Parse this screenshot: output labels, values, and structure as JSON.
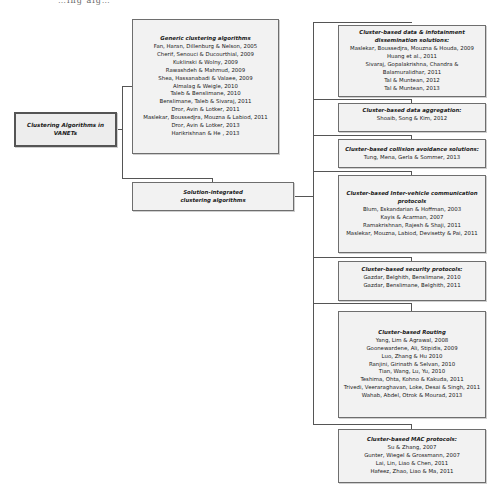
{
  "caption_fragment": "…ing alg…",
  "root": {
    "label": "Clustering Algorithms in VANETs"
  },
  "generic": {
    "title": "Generic clustering algorithms",
    "refs": [
      "Fan, Haran, Dillenburg & Nelson, 2005",
      "Cherif, Senouci & Ducourthial, 2009",
      "Kuklinski & Wolny, 2009",
      "Rawashdeh & Mahmud, 2009",
      "Shea, Hassanabadi & Valaee, 2009",
      "Almalag & Weigle, 2010",
      "Taleb & Benslimane, 2010",
      "Benslimane, Taleb & Sivaraj, 2011",
      "Dror, Avin & Lotker, 2011",
      "Maslekar, Boussedjra, Mouzna & Labiod, 2011",
      "Dror, Avin & Lotker, 2013",
      "Harikrishnan & He , 2013"
    ]
  },
  "solution": {
    "label": "Solution-integrated clustering algorithms"
  },
  "categories": [
    {
      "title": "Cluster-based data & infotainment dissemination solutions:",
      "refs": [
        "Maslekar, Boussedjra, Mouzna & Houda, 2009",
        "Huang et al., 2011",
        "Sivaraj, Gopalakrishna, Chandra & Balamuralidhar, 2011",
        "Tal & Muntean, 2012",
        "Tal & Muntean, 2013"
      ]
    },
    {
      "title": "Cluster-based data aggregation:",
      "refs": [
        "Shoaib,  Song & Kim, 2012"
      ]
    },
    {
      "title": "Cluster-based collision avoidance solutions:",
      "refs": [
        "Tung, Mena,  Gerla & Sommer, 2013"
      ]
    },
    {
      "title": "Cluster-based Inter-vehicle communication protocols",
      "refs": [
        "Blum, Eskandarian & Hoffman, 2003",
        "Kayis & Acarman, 2007",
        "Ramakrishnan, Rajesh & Shaji, 2011",
        "Maslekar, Mouzna, Labiod, Devisetty & Pai, 2011"
      ]
    },
    {
      "title": "Cluster-based security protocols:",
      "refs": [
        "Gazdar, Belghith, Benslimane, 2010",
        "Gazdar, Benslimane, Belghith, 2011"
      ]
    },
    {
      "title": "Cluster-based Routing",
      "refs": [
        "Yang, Lim & Agrawal, 2008",
        "Goonewardene, Ali, Stipidis, 2009",
        "Luo, Zhang & Hu 2010",
        "Ranjini, Girinath & Selvan, 2010",
        "Tian, Wang, Lu, Yu, 2010",
        "Teshima, Ohta, Kohno & Kakuda, 2011",
        "Trivedi, Veeraraghavan, Loke, Desai & Singh, 2011",
        "Wahab, Abdel, Otrok & Mourad, 2013"
      ]
    },
    {
      "title": "Cluster-based MAC protocols:",
      "refs": [
        "Su & Zhang, 2007",
        "Gunter, Wiegel & Grossmann, 2007",
        "Lai, Lin, Liao & Chen, 2011",
        "Hafeez, Zhao, Liao & Ma, 2011"
      ]
    }
  ]
}
